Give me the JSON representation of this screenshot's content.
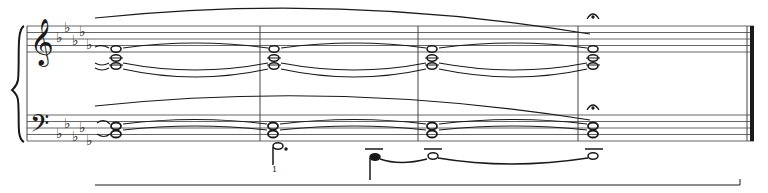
{
  "score": {
    "staves": [
      {
        "name": "treble",
        "clef": "treble",
        "top": 26,
        "spacing": 6.5
      },
      {
        "name": "bass",
        "clef": "bass",
        "top": 115,
        "spacing": 6.5
      }
    ],
    "key_signature": {
      "flats": 5
    },
    "barlines_x": [
      260,
      418,
      578
    ],
    "final_barline_x": 752,
    "staff_left": 27,
    "staff_right": 754,
    "fermatas": [
      "treble-last-chord",
      "bass-last-chord"
    ],
    "fingering": "1",
    "ottava_bracket": {
      "x1": 95,
      "x2": 740,
      "y": 185
    }
  },
  "colors": {
    "ink": "#1a1a1a",
    "staff": "#555555",
    "background": "#ffffff"
  }
}
